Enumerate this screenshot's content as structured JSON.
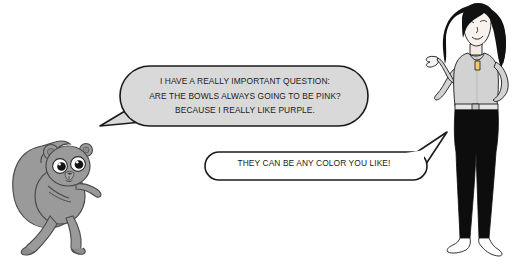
{
  "scene": {
    "title": "Comic panel: squirrel and woman conversation",
    "background_color": "#ffffff",
    "width": 531,
    "height": 268
  },
  "characters": [
    {
      "id": "squirrel",
      "name": "cartoon-squirrel",
      "description": "Gray cartoon squirrel standing with a large curled bushy tail, round ears, big white eyes with black pupils, one arm extended to the side",
      "body_color": "#9a9a9a",
      "outline_color": "#3a3a3a",
      "eye_white": "#ffffff",
      "eye_pupil": "#1a1a1a"
    },
    {
      "id": "woman",
      "name": "woman-character",
      "description": "Woman with long black hair standing, one hand raised in a gesture and the other on her hip, wearing a gray top with a pendant necklace, black pants and white pointed shoes",
      "hair_color": "#111111",
      "top_color": "#d2d2d2",
      "pants_color": "#0d0d0d",
      "skin_color": "#f7f2ee",
      "shoe_color": "#ffffff",
      "outline_color": "#1a1a1a"
    }
  ],
  "bubbles": [
    {
      "id": "bubble-squirrel",
      "speaker": "squirrel",
      "fill_color": "#d9d9d9",
      "outline_color": "#1b1b1b",
      "tail_direction": "left",
      "lines": [
        "I HAVE A REALLY IMPORTANT QUESTION:",
        "ARE THE BOWLS ALWAYS GOING TO BE PINK?",
        "BECAUSE I REALLY LIKE PURPLE."
      ]
    },
    {
      "id": "bubble-woman",
      "speaker": "woman",
      "fill_color": "#ffffff",
      "outline_color": "#1b1b1b",
      "tail_direction": "right",
      "lines": [
        "THEY CAN BE ANY COLOR YOU LIKE!"
      ]
    }
  ]
}
